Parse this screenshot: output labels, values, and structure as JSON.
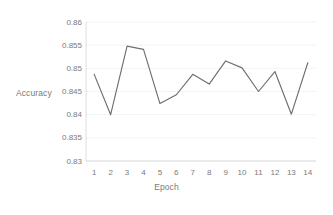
{
  "chart_data": {
    "type": "line",
    "title": "",
    "xlabel": "Epoch",
    "ylabel": "Accuracy",
    "categories": [
      1,
      2,
      3,
      4,
      5,
      6,
      7,
      8,
      9,
      10,
      11,
      12,
      13,
      14
    ],
    "x_tick_labels": [
      "1",
      "2",
      "3",
      "4",
      "5",
      "6",
      "7",
      "8",
      "9",
      "10",
      "11",
      "12",
      "13",
      "14"
    ],
    "y_tick_labels": [
      "0.86",
      "0.855",
      "0.85",
      "0.845",
      "0.84",
      "0.835",
      "0.83"
    ],
    "y_tick_values": [
      0.86,
      0.855,
      0.85,
      0.845,
      0.84,
      0.835,
      0.83
    ],
    "ylim": [
      0.83,
      0.86
    ],
    "xlim": [
      1,
      14
    ],
    "grid": true,
    "legend": false,
    "series": [
      {
        "name": "Accuracy",
        "color": "#6e6e6e",
        "values": [
          0.8487,
          0.84,
          0.8548,
          0.8541,
          0.8424,
          0.8443,
          0.8487,
          0.8466,
          0.8516,
          0.8501,
          0.845,
          0.8493,
          0.8401,
          0.8512
        ]
      }
    ]
  },
  "colors": {
    "line": "#6e6e6e",
    "text": "#7a7a7a",
    "grid": "#f0f0f0",
    "axis": "#d6d6d6",
    "background": "#ffffff"
  }
}
